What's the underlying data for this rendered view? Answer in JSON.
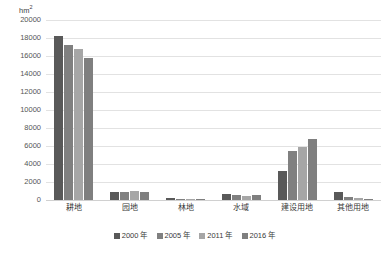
{
  "chart_data": {
    "type": "bar",
    "title": "",
    "subtitle": "",
    "xlabel": "",
    "ylabel": "hm²",
    "unit_caption": "hm",
    "unit_superscript": "2",
    "categories": [
      "耕地",
      "园地",
      "林地",
      "水域",
      "建设用地",
      "其他用地"
    ],
    "series": [
      {
        "name": "2000 年",
        "color": "#595959",
        "values": [
          18200,
          900,
          230,
          700,
          3250,
          900
        ]
      },
      {
        "name": "2005 年",
        "color": "#808080",
        "values": [
          17250,
          870,
          150,
          560,
          5500,
          330
        ]
      },
      {
        "name": "2011 年",
        "color": "#a6a6a6",
        "values": [
          16750,
          1000,
          120,
          430,
          5900,
          180
        ]
      },
      {
        "name": "2016 年",
        "color": "#7f7f7f",
        "values": [
          15800,
          900,
          110,
          600,
          6800,
          110
        ]
      }
    ],
    "ylim": [
      0,
      20000
    ],
    "ytick_step": 2000,
    "yticks": [
      "0",
      "2000",
      "4000",
      "6000",
      "8000",
      "10000",
      "12000",
      "14000",
      "16000",
      "18000",
      "20000"
    ],
    "grid": true,
    "grid_color": "#e2e2e2",
    "legend_position": "bottom",
    "background": "#ffffff"
  }
}
